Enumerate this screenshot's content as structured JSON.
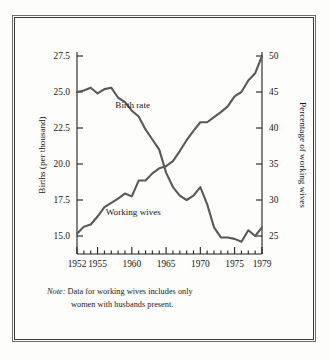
{
  "figure": {
    "note_label": "Note:",
    "note_line1": " Data for working wives includes only",
    "note_line2": "women with husbands present."
  },
  "chart_data": {
    "type": "line",
    "title": "",
    "subtitle": "",
    "xlabel": "",
    "ylabel": "Births (per thousand)",
    "y2label": "Percentage of working wives",
    "xlim": [
      1952,
      1979
    ],
    "ylim": [
      13.75,
      27.5
    ],
    "y2lim": [
      22.5,
      50
    ],
    "grid": false,
    "legend": "inline-annotations",
    "xticks": [
      1952,
      1955,
      1960,
      1965,
      1970,
      1975,
      1979
    ],
    "xtick_labels": [
      "1952",
      "1955",
      "1960",
      "1965",
      "1970",
      "1975",
      "1979"
    ],
    "xticks_minor_step": 1,
    "yticks": [
      15.0,
      17.5,
      20.0,
      22.5,
      25.0,
      27.5
    ],
    "ytick_labels": [
      "15.0",
      "17.5",
      "20.0",
      "22.5",
      "25.0",
      "27.5"
    ],
    "y2ticks": [
      25,
      30,
      35,
      40,
      45,
      50
    ],
    "y2tick_labels": [
      "25",
      "30",
      "35",
      "40",
      "45",
      "50"
    ],
    "series": [
      {
        "name": "Birth rate",
        "axis": "left",
        "units": "births per thousand",
        "color": "#595959",
        "annotation": "Birth rate",
        "x": [
          1952,
          1953,
          1954,
          1955,
          1956,
          1957,
          1958,
          1959,
          1960,
          1961,
          1962,
          1963,
          1964,
          1965,
          1966,
          1967,
          1968,
          1969,
          1970,
          1971,
          1972,
          1973,
          1974,
          1975,
          1976,
          1977,
          1978,
          1979
        ],
        "values": [
          25.0,
          25.1,
          25.3,
          24.9,
          25.2,
          25.3,
          24.6,
          24.3,
          23.7,
          23.3,
          22.4,
          21.7,
          21.0,
          19.4,
          18.4,
          17.8,
          17.5,
          17.8,
          18.4,
          17.2,
          15.6,
          14.9,
          14.9,
          14.8,
          14.6,
          15.4,
          15.0,
          15.6
        ]
      },
      {
        "name": "Working wives",
        "axis": "right",
        "units": "percent",
        "color": "#595959",
        "annotation": "Working wives",
        "x": [
          1952,
          1953,
          1954,
          1955,
          1956,
          1957,
          1958,
          1959,
          1960,
          1961,
          1962,
          1963,
          1964,
          1965,
          1966,
          1967,
          1968,
          1969,
          1970,
          1971,
          1972,
          1973,
          1974,
          1975,
          1976,
          1977,
          1978,
          1979
        ],
        "values": [
          25.3,
          26.3,
          26.6,
          27.7,
          29.0,
          29.6,
          30.2,
          30.9,
          30.5,
          32.7,
          32.7,
          33.7,
          34.4,
          34.7,
          35.4,
          36.8,
          38.3,
          39.6,
          40.8,
          40.8,
          41.5,
          42.2,
          43.0,
          44.4,
          45.0,
          46.6,
          47.6,
          50.0
        ]
      }
    ],
    "annotations": [
      {
        "text": "Birth rate",
        "x": 1957.6,
        "y_left": 24.1
      },
      {
        "text": "Working wives",
        "x": 1956.2,
        "y_left": 16.7
      }
    ]
  }
}
